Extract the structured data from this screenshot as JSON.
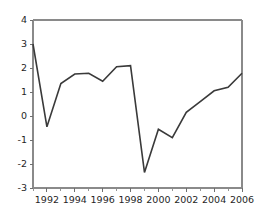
{
  "chart_data": {
    "type": "line",
    "title": "",
    "subtitle": "",
    "xlabel": "",
    "ylabel": "",
    "x": [
      1991,
      1992,
      1993,
      1994,
      1995,
      1996,
      1997,
      1998,
      1999,
      2000,
      2001,
      2002,
      2003,
      2004,
      2005,
      2006
    ],
    "values": [
      3.0,
      -0.45,
      1.35,
      1.75,
      1.78,
      1.45,
      2.05,
      2.1,
      -2.35,
      -0.55,
      -0.9,
      0.15,
      0.6,
      1.05,
      1.2,
      1.78
    ],
    "series": [
      {
        "name": "",
        "values": [
          3.0,
          -0.45,
          1.35,
          1.75,
          1.78,
          1.45,
          2.05,
          2.1,
          -2.35,
          -0.55,
          -0.9,
          0.15,
          0.6,
          1.05,
          1.2,
          1.78
        ]
      }
    ],
    "xlim": [
      1991,
      2006
    ],
    "ylim": [
      -3,
      4
    ],
    "y_ticks": [
      4,
      3,
      2,
      1,
      0,
      -1,
      -2,
      -3
    ],
    "y_tick_labels": [
      "4",
      "3",
      "2",
      "1",
      "0",
      "-1",
      "-2",
      "-3"
    ],
    "x_ticks": [
      1991,
      1992,
      1993,
      1994,
      1995,
      1996,
      1997,
      1998,
      1999,
      2000,
      2001,
      2002,
      2003,
      2004,
      2005,
      2006
    ],
    "x_tick_labels_shown": [
      "1992",
      "1994",
      "1996",
      "1998",
      "2000",
      "2002",
      "2004",
      "2006"
    ],
    "x_tick_label_values": [
      1992,
      1994,
      1996,
      1998,
      2000,
      2002,
      2004,
      2006
    ],
    "grid": false,
    "legend": false,
    "legend_position": "none",
    "annotations": [],
    "colors": {
      "line": "#3a3a3a",
      "axis": "#8a8a8a",
      "tick": "#6f6f6f",
      "text": "#1f1f1f",
      "background": "#ffffff"
    },
    "line_width": 1.6
  },
  "layout": {
    "plot_left": 33,
    "plot_right": 242,
    "plot_top": 20,
    "plot_bottom": 188
  }
}
